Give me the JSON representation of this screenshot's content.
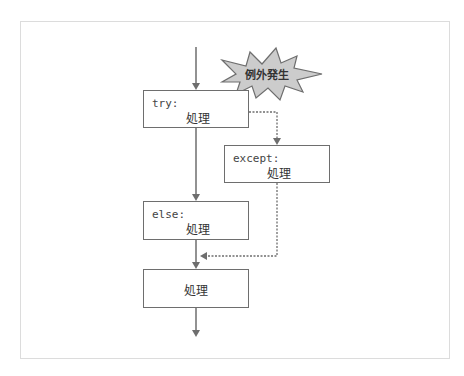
{
  "diagram": {
    "title": "",
    "nodes": {
      "try": {
        "keyword": "try:",
        "body": "処理"
      },
      "except": {
        "keyword": "except:",
        "body": "処理"
      },
      "else": {
        "keyword": "else:",
        "body": "処理"
      },
      "final": {
        "body": "処理"
      }
    },
    "burst": {
      "label": "例外発生"
    },
    "colors": {
      "line": "#6e6e6e",
      "box_border": "#6e6e6e",
      "burst_fill": "#cccccc",
      "frame_border": "#dcdcdc"
    }
  }
}
